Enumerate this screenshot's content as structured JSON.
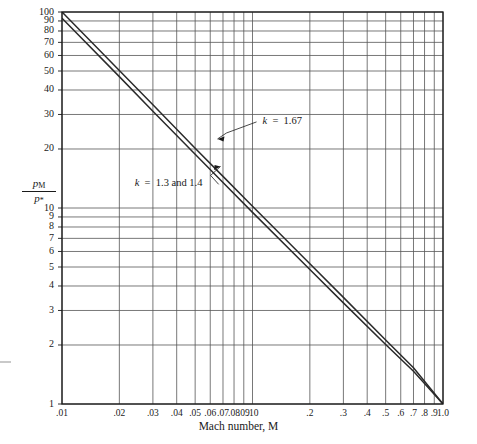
{
  "chart_data": {
    "type": "line",
    "title": "",
    "xlabel": "Mach number, M",
    "ylabel": "p_M / p_*",
    "xscale": "log",
    "yscale": "log",
    "xlim": [
      0.01,
      1.0
    ],
    "ylim": [
      1,
      100
    ],
    "grid": true,
    "legend": "inline-annotations",
    "xticks": [
      0.01,
      0.02,
      0.03,
      0.04,
      0.05,
      0.06,
      0.07,
      0.08,
      0.09,
      0.1,
      0.2,
      0.3,
      0.4,
      0.5,
      0.6,
      0.7,
      0.8,
      0.9,
      1.0
    ],
    "xticklabels": [
      ".01",
      ".02",
      ".03",
      ".04",
      ".05",
      ".06",
      ".07",
      ".08",
      ".09",
      ".10",
      ".2",
      ".3",
      ".4",
      ".5",
      ".6",
      ".7",
      ".8",
      ".9",
      "1.0"
    ],
    "yticks": [
      1,
      2,
      3,
      4,
      5,
      6,
      7,
      8,
      9,
      10,
      20,
      30,
      40,
      50,
      60,
      70,
      80,
      90,
      100
    ],
    "yticklabels": [
      "1",
      "2",
      "3",
      "4",
      "5",
      "6",
      "7",
      "8",
      "9",
      "10",
      "20",
      "30",
      "40",
      "50",
      "60",
      "70",
      "80",
      "90",
      "100"
    ],
    "series": [
      {
        "name": "k = 1.67",
        "annotation": "k  =  1.67",
        "x": [
          0.01,
          0.02,
          0.03,
          0.05,
          0.07,
          0.1,
          0.2,
          0.3,
          0.5,
          0.7,
          1.0
        ],
        "y": [
          100.0,
          50.3,
          33.6,
          20.2,
          14.5,
          10.2,
          5.2,
          3.5,
          2.12,
          1.53,
          1.0
        ]
      },
      {
        "name": "k = 1.3 and 1.4",
        "annotation": "k  =  1.3 and 1.4",
        "x": [
          0.01,
          0.02,
          0.03,
          0.05,
          0.07,
          0.1,
          0.2,
          0.3,
          0.5,
          0.7,
          1.0
        ],
        "y": [
          93.0,
          46.8,
          31.2,
          18.8,
          13.5,
          9.5,
          4.85,
          3.28,
          2.01,
          1.47,
          1.0
        ]
      }
    ],
    "annotations": [
      {
        "text": "k  =  1.67",
        "at_x": 0.0655,
        "at_y": 22.5,
        "label_x": 0.105,
        "label_y": 27.5
      },
      {
        "text": "k  =  1.3 and 1.4",
        "at_x": 0.068,
        "at_y": 16.3,
        "label_x": 0.0235,
        "label_y": 13.2
      }
    ]
  },
  "axes": {
    "y_title_numerator": "p",
    "y_title_numerator_sub": "M",
    "y_title_denominator": "p",
    "y_title_denominator_sub": "*",
    "x_title": "Mach number, M"
  }
}
